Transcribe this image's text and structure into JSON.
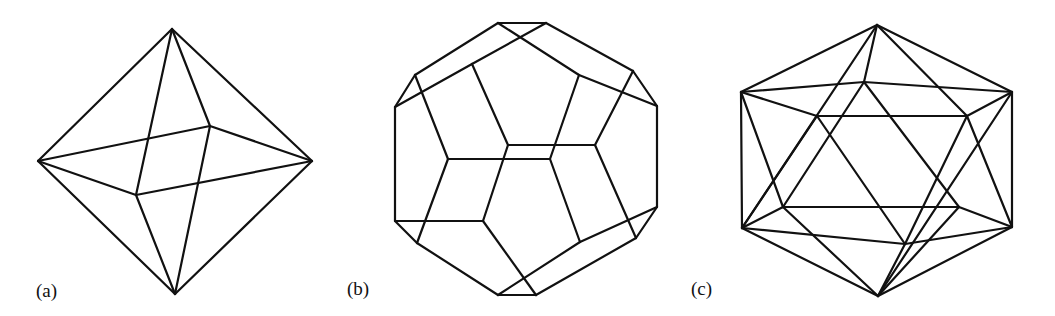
{
  "figure": {
    "panels": [
      {
        "id": "a",
        "label": "(a)",
        "solid": "octahedron",
        "label_pos": [
          36,
          280
        ],
        "vertices": {
          "T": [
            172,
            29
          ],
          "L": [
            38,
            161
          ],
          "R": [
            312,
            161
          ],
          "B": [
            175,
            294
          ],
          "BK": [
            210,
            126
          ],
          "FR": [
            136,
            195
          ]
        },
        "edges": [
          [
            "T",
            "L"
          ],
          [
            "T",
            "R"
          ],
          [
            "T",
            "BK"
          ],
          [
            "T",
            "FR"
          ],
          [
            "B",
            "L"
          ],
          [
            "B",
            "R"
          ],
          [
            "B",
            "BK"
          ],
          [
            "B",
            "FR"
          ],
          [
            "L",
            "BK"
          ],
          [
            "BK",
            "R"
          ],
          [
            "R",
            "FR"
          ],
          [
            "FR",
            "L"
          ]
        ]
      },
      {
        "id": "b",
        "label": "(b)",
        "solid": "dodecahedron",
        "label_pos": [
          347,
          278
        ],
        "vertices": {
          "A": [
            498,
            23
          ],
          "Bv": [
            546,
            23
          ],
          "C": [
            415,
            75
          ],
          "D": [
            395,
            107
          ],
          "E": [
            633,
            71
          ],
          "F": [
            657,
            106
          ],
          "G": [
            472,
            64
          ],
          "H": [
            579,
            75
          ],
          "I": [
            508,
            145
          ],
          "J": [
            595,
            145
          ],
          "K": [
            448,
            159
          ],
          "L": [
            550,
            159
          ],
          "M": [
            395,
            221
          ],
          "N": [
            483,
            221
          ],
          "O": [
            417,
            243
          ],
          "P": [
            657,
            207
          ],
          "Q": [
            636,
            238
          ],
          "R": [
            580,
            242
          ],
          "S": [
            498,
            295
          ],
          "U": [
            536,
            295
          ]
        },
        "edges": [
          [
            "A",
            "Bv"
          ],
          [
            "A",
            "C"
          ],
          [
            "Bv",
            "G"
          ],
          [
            "G",
            "D"
          ],
          [
            "A",
            "H"
          ],
          [
            "H",
            "F"
          ],
          [
            "Bv",
            "E"
          ],
          [
            "C",
            "D"
          ],
          [
            "E",
            "F"
          ],
          [
            "C",
            "K"
          ],
          [
            "D",
            "M"
          ],
          [
            "G",
            "I"
          ],
          [
            "H",
            "L"
          ],
          [
            "E",
            "J"
          ],
          [
            "F",
            "P"
          ],
          [
            "I",
            "J"
          ],
          [
            "K",
            "L"
          ],
          [
            "I",
            "N"
          ],
          [
            "K",
            "O"
          ],
          [
            "M",
            "N"
          ],
          [
            "M",
            "O"
          ],
          [
            "L",
            "R"
          ],
          [
            "J",
            "Q"
          ],
          [
            "N",
            "U"
          ],
          [
            "O",
            "S"
          ],
          [
            "P",
            "Q"
          ],
          [
            "P",
            "R"
          ],
          [
            "Q",
            "U"
          ],
          [
            "R",
            "S"
          ],
          [
            "S",
            "U"
          ]
        ]
      },
      {
        "id": "c",
        "label": "(c)",
        "solid": "icosahedron",
        "label_pos": [
          691,
          278
        ],
        "vertices": {
          "T": [
            877,
            25
          ],
          "B": [
            878,
            296
          ],
          "UL": [
            741,
            92
          ],
          "UR": [
            1012,
            92
          ],
          "LL": [
            742,
            228
          ],
          "LR": [
            1012,
            227
          ],
          "BU": [
            864,
            82
          ],
          "FUL": [
            817,
            116
          ],
          "FUR": [
            967,
            116
          ],
          "FLL": [
            783,
            207
          ],
          "FLR": [
            959,
            207
          ],
          "BL": [
            905,
            244
          ]
        },
        "edges": [
          [
            "T",
            "UL"
          ],
          [
            "T",
            "UR"
          ],
          [
            "T",
            "BU"
          ],
          [
            "T",
            "LL"
          ],
          [
            "T",
            "FUR"
          ],
          [
            "UL",
            "BU"
          ],
          [
            "BU",
            "UR"
          ],
          [
            "UL",
            "FUL"
          ],
          [
            "FUL",
            "FUR"
          ],
          [
            "FUR",
            "UR"
          ],
          [
            "UL",
            "LL"
          ],
          [
            "UR",
            "LR"
          ],
          [
            "UL",
            "FLL"
          ],
          [
            "BU",
            "FLL"
          ],
          [
            "BU",
            "FLR"
          ],
          [
            "FUL",
            "LL"
          ],
          [
            "FUL",
            "BL"
          ],
          [
            "FUR",
            "BL"
          ],
          [
            "FUR",
            "LR"
          ],
          [
            "UR",
            "B"
          ],
          [
            "FLL",
            "FLR"
          ],
          [
            "LL",
            "FLL"
          ],
          [
            "FLR",
            "LR"
          ],
          [
            "LL",
            "BL"
          ],
          [
            "BL",
            "LR"
          ],
          [
            "LL",
            "B"
          ],
          [
            "FLL",
            "B"
          ],
          [
            "BL",
            "B"
          ],
          [
            "FLR",
            "B"
          ],
          [
            "LR",
            "B"
          ]
        ]
      }
    ]
  }
}
